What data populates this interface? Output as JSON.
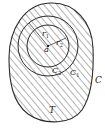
{
  "diagram": {
    "type": "region-with-concentric-circles",
    "labels": {
      "outer_curve": "C",
      "region": "T",
      "center_point": "a",
      "outer_circle": "C",
      "outer_circle_sub": "1",
      "inner_circle": "C",
      "inner_circle_sub": "2",
      "radius_outer": "r",
      "radius_outer_sub": "1",
      "radius_inner": "r",
      "radius_inner_sub": "2"
    },
    "colors": {
      "stroke": "#2a2a2a",
      "hatch": "#555555",
      "background": "#ffffff"
    }
  }
}
